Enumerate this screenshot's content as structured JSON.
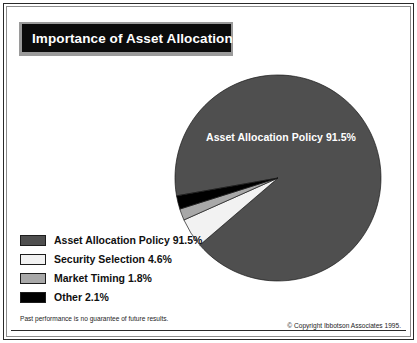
{
  "title": {
    "text": "Importance of Asset Allocation"
  },
  "pie_label": "Asset Allocation Policy 91.5%",
  "legend": {
    "items": [
      {
        "label": "Asset Allocation Policy 91.5%",
        "color": "#4f4f4f",
        "name": "legend-asset-allocation-policy"
      },
      {
        "label": "Security Selection 4.6%",
        "color": "#f2f2f2",
        "name": "legend-security-selection"
      },
      {
        "label": "Market Timing 1.8%",
        "color": "#a8a8a8",
        "name": "legend-market-timing"
      },
      {
        "label": "Other 2.1%",
        "color": "#000000",
        "name": "legend-other"
      }
    ]
  },
  "footer": {
    "disclaimer": "Past performance is no guarantee of future results.",
    "copyright": "© Copyright Ibbotson Associates 1995."
  },
  "chart_data": {
    "type": "pie",
    "title": "Importance of Asset Allocation",
    "categories": [
      "Asset Allocation Policy",
      "Security Selection",
      "Market Timing",
      "Other"
    ],
    "values": [
      91.5,
      4.6,
      1.8,
      2.1
    ],
    "unit": "%",
    "colors": [
      "#4f4f4f",
      "#f2f2f2",
      "#a8a8a8",
      "#000000"
    ],
    "labels": [
      "Asset Allocation Policy 91.5%",
      "Security Selection 4.6%",
      "Market Timing 1.8%",
      "Other 2.1%"
    ],
    "legend_position": "bottom-left",
    "start_angle_deg": 190,
    "direction": "clockwise",
    "annotations": [
      "Asset Allocation Policy 91.5%"
    ],
    "center_px": [
      278,
      178
    ],
    "radius_px": 103,
    "grid": false,
    "xlabel": "",
    "ylabel": ""
  }
}
